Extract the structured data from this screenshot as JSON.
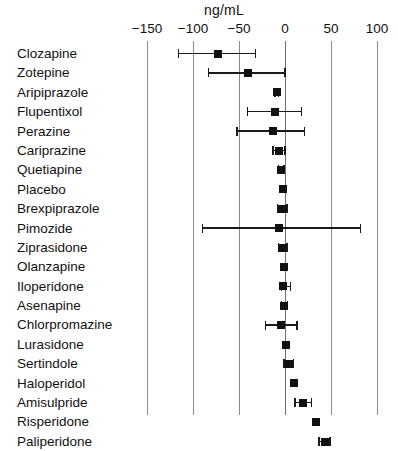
{
  "chart_data": {
    "type": "scatter",
    "title": "",
    "subtitle": "",
    "xlabel": "ng/mL",
    "ylabel": "",
    "unit_header": "ng/mL",
    "xlim": [
      -175,
      120
    ],
    "xticks": [
      -150,
      -100,
      -50,
      0,
      50,
      100
    ],
    "xticklabels": [
      "−150",
      "−100",
      "−50",
      "0",
      "50",
      "100"
    ],
    "grid": true,
    "legend": null,
    "reference_line": 0,
    "categories": [
      "Clozapine",
      "Zotepine",
      "Aripiprazole",
      "Flupentixol",
      "Perazine",
      "Cariprazine",
      "Quetiapine",
      "Placebo",
      "Brexpiprazole",
      "Pimozide",
      "Ziprasidone",
      "Olanzapine",
      "Iloperidone",
      "Asenapine",
      "Chlorpromazine",
      "Lurasidone",
      "Sertindole",
      "Haloperidol",
      "Amisulpride",
      "Risperidone",
      "Paliperidone"
    ],
    "values": [
      -73,
      -40,
      -9,
      -11,
      -13,
      -6,
      -4,
      -2,
      -3,
      -6,
      -3,
      -1,
      -2,
      -1,
      -4,
      1,
      4,
      10,
      20,
      34,
      43
    ],
    "ci_low": [
      -116,
      -83,
      -11,
      -41,
      -52,
      -13,
      -7,
      -2,
      -8,
      -90,
      -7,
      -1,
      -4,
      -4,
      -21,
      1,
      -1,
      10,
      11,
      34,
      37
    ],
    "ci_high": [
      -32,
      0,
      -7,
      18,
      21,
      0,
      -1,
      -2,
      2,
      82,
      2,
      -1,
      6,
      3,
      13,
      1,
      9,
      10,
      29,
      34,
      49
    ],
    "series": [
      {
        "name": "Mean difference with 95% CI",
        "points": [
          {
            "label": "Clozapine",
            "value": -73,
            "low": -116,
            "high": -32
          },
          {
            "label": "Zotepine",
            "value": -40,
            "low": -83,
            "high": 0
          },
          {
            "label": "Aripiprazole",
            "value": -9,
            "low": -11,
            "high": -7
          },
          {
            "label": "Flupentixol",
            "value": -11,
            "low": -41,
            "high": 18
          },
          {
            "label": "Perazine",
            "value": -13,
            "low": -52,
            "high": 21
          },
          {
            "label": "Cariprazine",
            "value": -6,
            "low": -13,
            "high": 0
          },
          {
            "label": "Quetiapine",
            "value": -4,
            "low": -7,
            "high": -1
          },
          {
            "label": "Placebo",
            "value": -2,
            "low": -2,
            "high": -2
          },
          {
            "label": "Brexpiprazole",
            "value": -3,
            "low": -8,
            "high": 2
          },
          {
            "label": "Pimozide",
            "value": -6,
            "low": -90,
            "high": 82
          },
          {
            "label": "Ziprasidone",
            "value": -3,
            "low": -7,
            "high": 2
          },
          {
            "label": "Olanzapine",
            "value": -1,
            "low": -1,
            "high": -1
          },
          {
            "label": "Iloperidone",
            "value": -2,
            "low": -4,
            "high": 6
          },
          {
            "label": "Asenapine",
            "value": -1,
            "low": -4,
            "high": 3
          },
          {
            "label": "Chlorpromazine",
            "value": -4,
            "low": -21,
            "high": 13
          },
          {
            "label": "Lurasidone",
            "value": 1,
            "low": 1,
            "high": 1
          },
          {
            "label": "Sertindole",
            "value": 4,
            "low": -1,
            "high": 9
          },
          {
            "label": "Haloperidol",
            "value": 10,
            "low": 10,
            "high": 10
          },
          {
            "label": "Amisulpride",
            "value": 20,
            "low": 11,
            "high": 29
          },
          {
            "label": "Risperidone",
            "value": 34,
            "low": 34,
            "high": 34
          },
          {
            "label": "Paliperidone",
            "value": 43,
            "low": 37,
            "high": 49
          }
        ]
      }
    ]
  },
  "colors": {
    "marker": "#111111",
    "gridline": "#8c8c8c",
    "text": "#111111",
    "background": "#ffffff"
  }
}
